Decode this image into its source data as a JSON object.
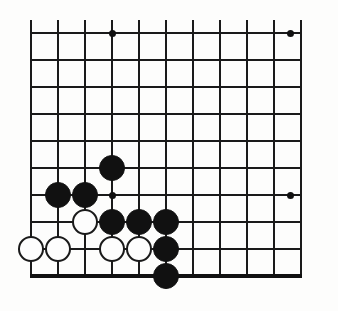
{
  "figure": {
    "type": "go-board-diagram"
  },
  "board": {
    "background_color": "#fdfdfc",
    "line_color": "#1a1a1a",
    "black_stone_color": "#111111",
    "white_stone_color": "#fdfdfd",
    "white_stone_border_color": "#1a1a1a",
    "origin_x": 31,
    "origin_y": 33,
    "spacing": 27,
    "columns": 10,
    "rows": 9,
    "stone_radius": 13,
    "line_width": 2,
    "edge_line_width": 4,
    "vertical_overhang_top": 13,
    "horizontal_overhang_right": 14,
    "bottom_edge_row": 9,
    "right_cut_x": 303,
    "top_cut_y": 20
  },
  "star_points": [
    {
      "col": 3,
      "row": 0,
      "name": "star-point-upper-left"
    },
    {
      "col": 9.6,
      "row": 0,
      "name": "star-point-upper-right"
    },
    {
      "col": 3,
      "row": 6,
      "name": "star-point-lower-left"
    },
    {
      "col": 9.6,
      "row": 6,
      "name": "star-point-lower-right"
    }
  ],
  "stones": [
    {
      "color": "black",
      "col": 3,
      "row": 5,
      "label": "black-stone-d5"
    },
    {
      "color": "black",
      "col": 1,
      "row": 6,
      "label": "black-stone-b6"
    },
    {
      "color": "black",
      "col": 2,
      "row": 6,
      "label": "black-stone-c6"
    },
    {
      "color": "white",
      "col": 2,
      "row": 7,
      "label": "white-stone-c7"
    },
    {
      "color": "black",
      "col": 3,
      "row": 7,
      "label": "black-stone-d7"
    },
    {
      "color": "black",
      "col": 4,
      "row": 7,
      "label": "black-stone-e7"
    },
    {
      "color": "black",
      "col": 5,
      "row": 7,
      "label": "black-stone-f7"
    },
    {
      "color": "white",
      "col": 0,
      "row": 8,
      "label": "white-stone-a8"
    },
    {
      "color": "white",
      "col": 1,
      "row": 8,
      "label": "white-stone-b8"
    },
    {
      "color": "white",
      "col": 3,
      "row": 8,
      "label": "white-stone-d8"
    },
    {
      "color": "white",
      "col": 4,
      "row": 8,
      "label": "white-stone-e8"
    },
    {
      "color": "black",
      "col": 5,
      "row": 8,
      "label": "black-stone-f8"
    },
    {
      "color": "black",
      "col": 5,
      "row": 9,
      "label": "black-stone-f9"
    }
  ],
  "counts": {
    "black_stones": 8,
    "white_stones": 5,
    "total_stones": 13
  }
}
